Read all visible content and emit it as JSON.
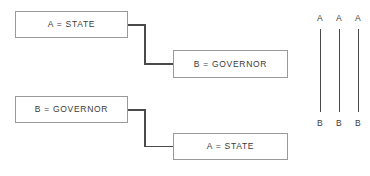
{
  "diagram": {
    "type": "relation-mapping-diagram",
    "background_color": "#ffffff",
    "box_border_color": "#9a9a9a",
    "line_color": "#4a4a4a",
    "text_color": "#3a3a3a",
    "pairs": [
      {
        "source": {
          "label": "A = STATE",
          "variable": "A",
          "value": "STATE"
        },
        "target": {
          "label": "B = GOVERNOR",
          "variable": "B",
          "value": "GOVERNOR"
        }
      },
      {
        "source": {
          "label": "B = GOVERNOR",
          "variable": "B",
          "value": "GOVERNOR"
        },
        "target": {
          "label": "A = STATE",
          "variable": "A",
          "value": "STATE"
        }
      }
    ],
    "mapping": {
      "columns": [
        {
          "top_label": "A",
          "bottom_label": "B"
        },
        {
          "top_label": "A",
          "bottom_label": "B"
        },
        {
          "top_label": "A",
          "bottom_label": "B"
        }
      ]
    }
  }
}
